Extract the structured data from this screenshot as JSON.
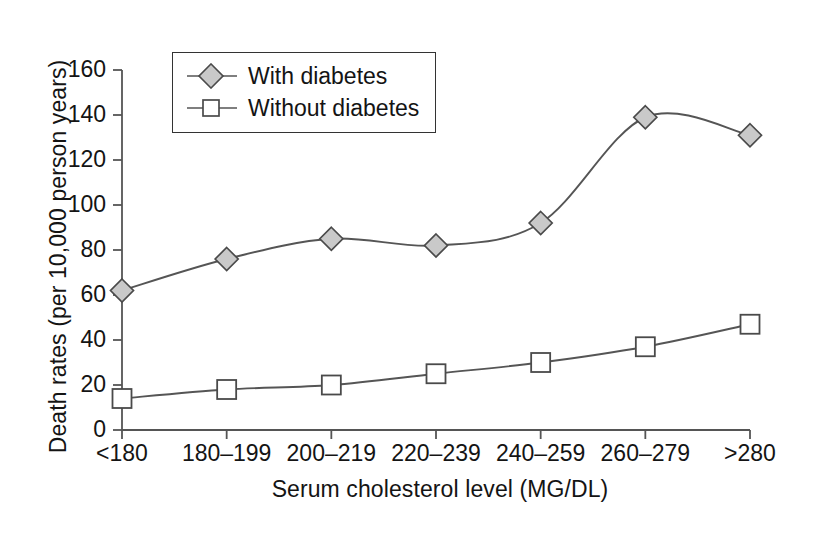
{
  "chart_data": {
    "type": "line",
    "title": "",
    "xlabel": "Serum cholesterol level (MG/DL)",
    "ylabel": "Death rates (per 10,000 person years)",
    "categories": [
      "<180",
      "180–199",
      "200–219",
      "220–239",
      "240–259",
      "260–279",
      ">280"
    ],
    "yticks": [
      0,
      20,
      40,
      60,
      80,
      100,
      120,
      140,
      160
    ],
    "ylim": [
      0,
      160
    ],
    "grid": false,
    "legend_position": "top-left-inside",
    "series": [
      {
        "name": "With diabetes",
        "marker": "filled-diamond",
        "marker_fill": "#c9c9c9",
        "line_color": "#555555",
        "values": [
          62,
          76,
          85,
          82,
          92,
          139,
          131
        ]
      },
      {
        "name": "Without diabetes",
        "marker": "open-square",
        "marker_fill": "#ffffff",
        "line_color": "#555555",
        "values": [
          14,
          18,
          20,
          25,
          30,
          37,
          47
        ]
      }
    ]
  },
  "legend": {
    "items": [
      {
        "label": "With diabetes",
        "marker": "filled-diamond-icon"
      },
      {
        "label": "Without diabetes",
        "marker": "open-square-icon"
      }
    ]
  },
  "axes": {
    "y_title": "Death rates (per 10,000 person years)",
    "x_title": "Serum cholesterol level (MG/DL)",
    "y_tick_labels": [
      "0",
      "20",
      "40",
      "60",
      "80",
      "100",
      "120",
      "140",
      "160"
    ],
    "x_tick_labels": [
      "<180",
      "180–199",
      "200–219",
      "220–239",
      "240–259",
      "260–279",
      ">280"
    ]
  },
  "colors": {
    "axis": "#555555",
    "text": "#141414",
    "marker_fill_diamond": "#c9c9c9",
    "marker_fill_square": "#ffffff",
    "marker_stroke": "#4a4a4a",
    "background": "#ffffff"
  }
}
